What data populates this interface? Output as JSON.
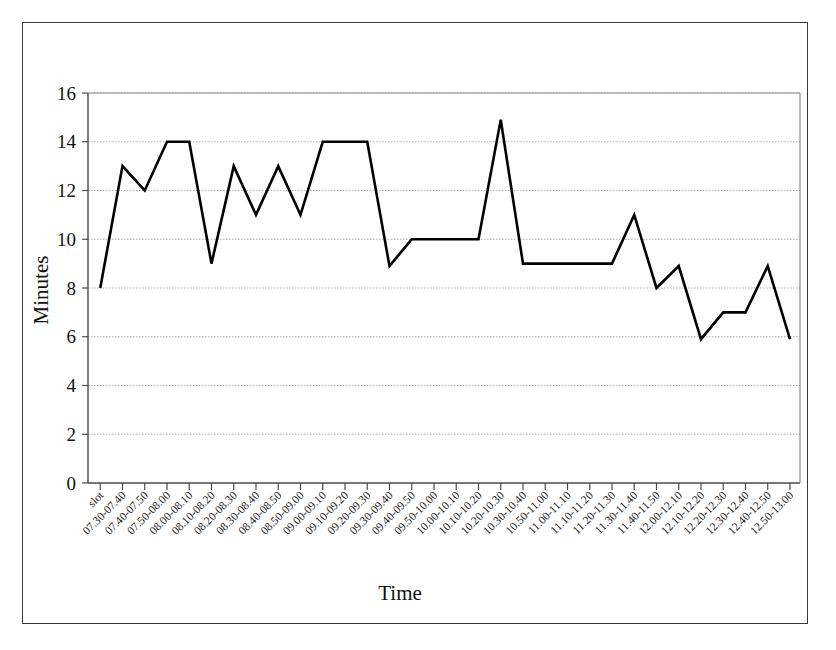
{
  "chart_data": {
    "type": "line",
    "title": "",
    "xlabel": "Time",
    "ylabel": "Minutes",
    "ylim": [
      0,
      16
    ],
    "ytick_step": 2,
    "yticks": [
      0,
      2,
      4,
      6,
      8,
      10,
      12,
      14,
      16
    ],
    "grid": true,
    "grid_axis": "y",
    "legend": "none",
    "line_color": "#000000",
    "line_width": 2.6,
    "categories": [
      "slot",
      "07.30-07.40",
      "07.40-07.50",
      "07.50-08.00",
      "08.00-08.10",
      "08.10-08.20",
      "08.20-08.30",
      "08.30-08.40",
      "08.40-08.50",
      "08.50-09.00",
      "09.00-09.10",
      "09.10-09.20",
      "09.20-09.30",
      "09.30-09.40",
      "09.40-09.50",
      "09.50-10.00",
      "10.00-10.10",
      "10.10-10.20",
      "10.20-10.30",
      "10.30-10.40",
      "10.50-11.00",
      "11.00-11.10",
      "11.10-11.20",
      "11.20-11.30",
      "11.30-11.40",
      "11.40-11.50",
      "12.00-12.10",
      "12.10-12.20",
      "12.20-12.30",
      "12.30-12.40",
      "12.40-12.50",
      "12.50-13.00"
    ],
    "values": [
      8,
      13,
      12,
      14,
      14,
      9,
      13,
      11,
      13,
      11,
      14,
      14,
      14,
      8.9,
      10,
      10,
      10,
      10,
      14.9,
      9,
      9,
      9,
      9,
      9,
      11,
      8,
      8.9,
      5.9,
      7,
      7,
      8.9,
      5.9
    ]
  },
  "axes": {
    "y_title": "Minutes",
    "x_title": "Time"
  }
}
